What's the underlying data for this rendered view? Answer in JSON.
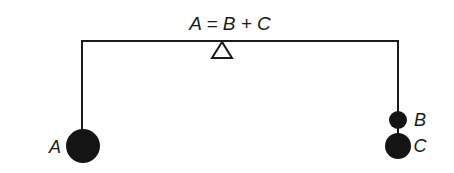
{
  "diagram": {
    "title": "A = B + C",
    "colors": {
      "background": "#ffffff",
      "line": "#1a1a1a",
      "mass": "#141414"
    },
    "beam": {
      "left_x": 82,
      "right_x": 398,
      "y": 41
    },
    "fulcrum": {
      "x": 222,
      "shape": "triangle"
    },
    "masses": [
      {
        "label": "A",
        "side": "left",
        "cx": 83,
        "cy": 146,
        "r": 17
      },
      {
        "label": "B",
        "side": "right",
        "cx": 398,
        "cy": 120,
        "r": 9
      },
      {
        "label": "C",
        "side": "right",
        "cx": 398,
        "cy": 146,
        "r": 13
      }
    ]
  }
}
